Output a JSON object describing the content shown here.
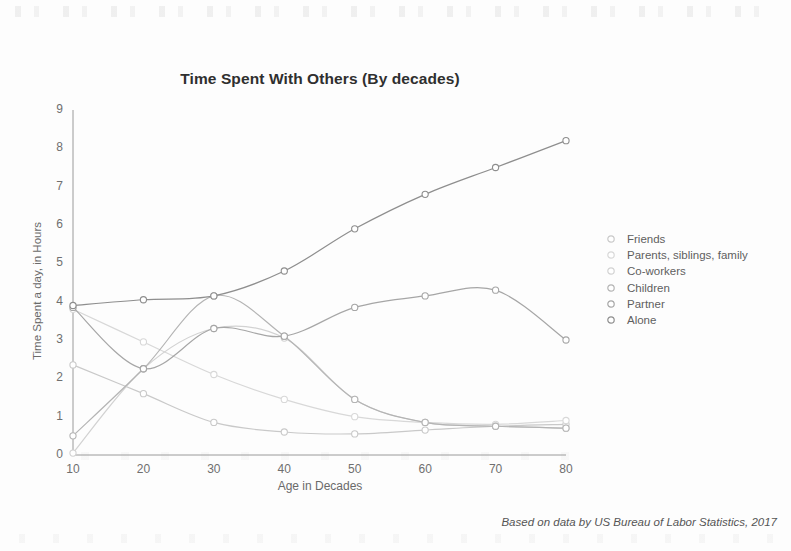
{
  "chart_data": {
    "type": "line",
    "title": "Time Spent With Others (By decades)",
    "xlabel": "Age in Decades",
    "ylabel": "Time Spent a day, in Hours",
    "xlim": [
      10,
      80
    ],
    "ylim": [
      0,
      9
    ],
    "x": [
      10,
      20,
      30,
      40,
      50,
      60,
      70,
      80
    ],
    "xticks": [
      "10",
      "20",
      "30",
      "40",
      "50",
      "60",
      "70",
      "80"
    ],
    "yticks": [
      "0",
      "1",
      "2",
      "3",
      "4",
      "5",
      "6",
      "7",
      "8",
      "9"
    ],
    "grid": false,
    "legend_position": "right",
    "footnote": "Based on data by US Bureau of Labor Statistics, 2017",
    "series": [
      {
        "name": "Friends",
        "color": "#c9c9c9",
        "values": [
          2.35,
          1.6,
          0.85,
          0.6,
          0.55,
          0.65,
          0.75,
          0.8
        ]
      },
      {
        "name": "Parents, siblings, family",
        "color": "#d8d8d8",
        "values": [
          3.8,
          2.95,
          2.1,
          1.45,
          1.0,
          0.85,
          0.8,
          0.9
        ]
      },
      {
        "name": "Co-workers",
        "color": "#d2d2d2",
        "values": [
          0.05,
          2.25,
          3.3,
          3.05,
          1.45,
          0.85,
          0.75,
          0.7
        ]
      },
      {
        "name": "Children",
        "color": "#b4b4b4",
        "values": [
          0.5,
          2.25,
          4.15,
          3.1,
          1.45,
          0.85,
          0.75,
          0.7
        ]
      },
      {
        "name": "Partner",
        "color": "#a6a6a6",
        "values": [
          3.85,
          2.25,
          3.3,
          3.1,
          3.85,
          4.15,
          4.3,
          3.0
        ]
      },
      {
        "name": "Alone",
        "color": "#8e8e8e",
        "values": [
          3.9,
          4.05,
          4.15,
          4.8,
          5.9,
          6.8,
          7.5,
          8.2
        ]
      }
    ]
  },
  "legend": {
    "items": [
      {
        "label": "Friends"
      },
      {
        "label": "Parents, siblings, family"
      },
      {
        "label": "Co-workers"
      },
      {
        "label": "Children"
      },
      {
        "label": "Partner"
      },
      {
        "label": "Alone"
      }
    ]
  }
}
